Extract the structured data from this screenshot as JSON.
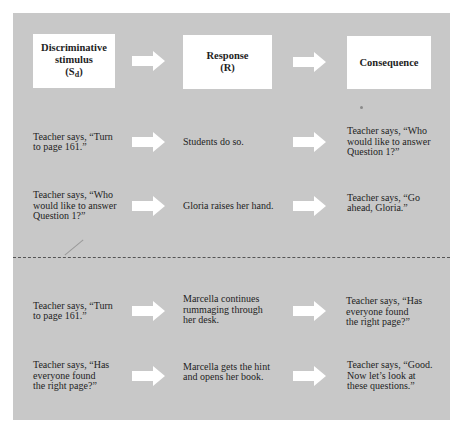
{
  "headers": [
    {
      "lines": [
        "Discriminative",
        "stimulus"
      ],
      "symbol": "(S",
      "subscript": "d",
      "symbol_close": ")"
    },
    {
      "lines": [
        "Response",
        "(R)"
      ]
    },
    {
      "lines": [
        "Consequence"
      ]
    }
  ],
  "arrow_icon": "right-arrow",
  "colors": {
    "panel": "#c8c8c8",
    "box": "#ffffff",
    "arrow": "#ffffff",
    "divider": "#555555"
  },
  "rows": [
    {
      "stimulus": "Teacher says, “Turn\nto page 161.”",
      "response": "Students do so.",
      "consequence": "Teacher says, “Who\nwould like to answer\nQuestion 1?”"
    },
    {
      "stimulus": "Teacher says, “Who\nwould like to answer\nQuestion 1?”",
      "response": "Gloria raises her hand.",
      "consequence": "Teacher says, “Go\nahead, Gloria.”"
    },
    {
      "stimulus": "Teacher says, “Turn\nto page 161.”",
      "response": "Marcella continues\nrummaging through\nher desk.",
      "consequence": "Teacher says, “Has\neveryone found\nthe right page?”"
    },
    {
      "stimulus": "Teacher says, “Has\neveryone found\nthe right page?”",
      "response": "Marcella gets the hint\nand  opens her book.",
      "consequence": "Teacher says, “Good.\nNow let’s look at\nthese questions.”"
    }
  ]
}
